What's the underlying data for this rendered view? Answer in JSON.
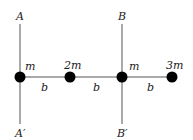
{
  "axes": [
    {
      "top_label": "A",
      "bottom_label": "A′"
    },
    {
      "top_label": "B",
      "bottom_label": "B′"
    }
  ],
  "masses": [
    {
      "label": "m"
    },
    {
      "label": "2m"
    },
    {
      "label": "m"
    },
    {
      "label": "3m"
    }
  ],
  "spacings": [
    {
      "label": "b"
    },
    {
      "label": "b"
    },
    {
      "label": "b"
    }
  ],
  "colors": {
    "line": "#555555",
    "mass": "#000000"
  }
}
